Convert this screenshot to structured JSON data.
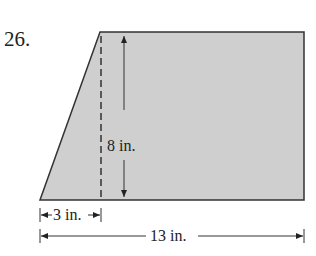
{
  "problem": {
    "number": "26."
  },
  "figure": {
    "shape": "trapezoid",
    "fill_color": "#cfcfcf",
    "stroke_color": "#333333",
    "labels": {
      "height": "8 in.",
      "offset": "3 in.",
      "base": "13 in."
    }
  }
}
